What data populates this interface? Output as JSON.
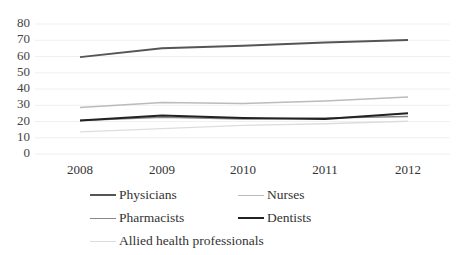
{
  "chart_data": {
    "type": "line",
    "title": "",
    "xlabel": "",
    "ylabel": "",
    "x": [
      "2008",
      "2009",
      "2010",
      "2011",
      "2012"
    ],
    "ylim": [
      0,
      80
    ],
    "yticks": [
      "0",
      "10",
      "20",
      "30",
      "40",
      "50",
      "60",
      "70",
      "80"
    ],
    "grid": true,
    "legend_position": "bottom",
    "series": [
      {
        "name": "Physicians",
        "values": [
          59,
          64.5,
          66,
          68,
          69.5
        ],
        "color": "#555555",
        "width": 2
      },
      {
        "name": "Nurses",
        "values": [
          28,
          31,
          30.5,
          32,
          34.5
        ],
        "color": "#bbbbbb",
        "width": 1.5
      },
      {
        "name": "Pharmacists",
        "values": [
          20,
          22,
          21,
          21.5,
          22.5
        ],
        "color": "#888888",
        "width": 1.5
      },
      {
        "name": "Dentists",
        "values": [
          20,
          23,
          21.5,
          21,
          24.5
        ],
        "color": "#222222",
        "width": 2
      },
      {
        "name": "Allied health professionals",
        "values": [
          13,
          15,
          17,
          18,
          19.5
        ],
        "color": "#dddddd",
        "width": 1.5
      }
    ]
  },
  "legend": {
    "items": [
      {
        "label": "Physicians"
      },
      {
        "label": "Nurses"
      },
      {
        "label": "Pharmacists"
      },
      {
        "label": "Dentists"
      },
      {
        "label": "Allied health professionals"
      }
    ]
  }
}
